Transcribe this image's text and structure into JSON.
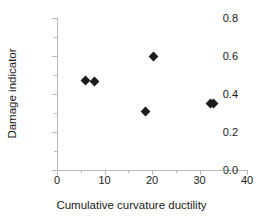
{
  "chart_data": {
    "type": "scatter",
    "title": "",
    "xlabel": "Cumulative curvature ductility",
    "ylabel": "Damage indicator",
    "xlim": [
      0,
      40
    ],
    "ylim": [
      0.0,
      0.8
    ],
    "x_ticks": [
      "0",
      "10",
      "20",
      "30",
      "40"
    ],
    "x_tick_values": [
      0,
      10,
      20,
      30,
      40
    ],
    "x_minor_tick_values": [
      5,
      15,
      25,
      35
    ],
    "y_ticks": [
      "0.0",
      "0.2",
      "0.4",
      "0.6",
      "0.8"
    ],
    "y_tick_values": [
      0.0,
      0.2,
      0.4,
      0.6,
      0.8
    ],
    "y_minor_tick_values": [
      0.1,
      0.3,
      0.5,
      0.7
    ],
    "grid": false,
    "legend": null,
    "marker": "diamond",
    "marker_color": "#1c1c1c",
    "points": [
      {
        "x": 6.1,
        "y": 0.472
      },
      {
        "x": 7.9,
        "y": 0.468
      },
      {
        "x": 18.6,
        "y": 0.31
      },
      {
        "x": 20.3,
        "y": 0.6
      },
      {
        "x": 32.3,
        "y": 0.352
      },
      {
        "x": 33.0,
        "y": 0.352
      }
    ]
  },
  "axes": {
    "line_color": "#b9b9b9",
    "text_color": "#1a1a1a"
  }
}
